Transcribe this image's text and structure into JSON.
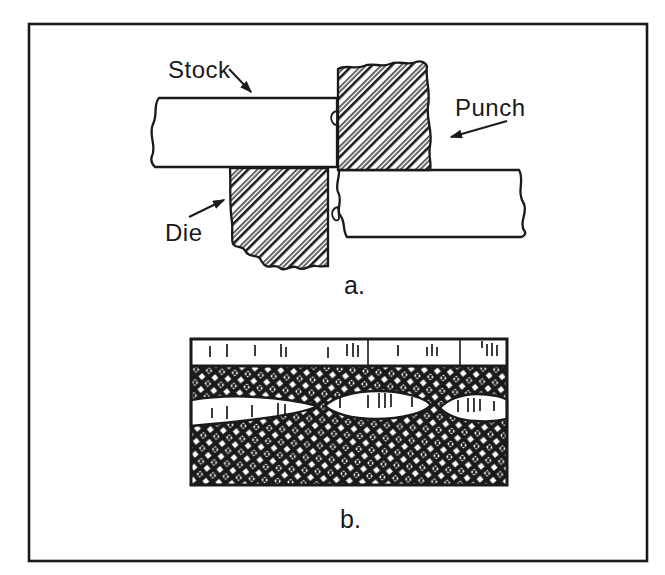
{
  "figure": {
    "colors": {
      "ink": "#1a1a1a",
      "paper": "#ffffff"
    },
    "panel_a": {
      "caption": "a.",
      "stock_label": "Stock",
      "punch_label": "Punch",
      "die_label": "Die"
    },
    "panel_b": {
      "caption": "b.",
      "ticks": {
        "strip": [
          {
            "x": 210,
            "y": 346,
            "h": 11
          },
          {
            "x": 227,
            "y": 344,
            "h": 13
          },
          {
            "x": 255,
            "y": 345,
            "h": 11
          },
          {
            "x": 281,
            "y": 344,
            "h": 13
          },
          {
            "x": 286,
            "y": 347,
            "h": 10
          },
          {
            "x": 328,
            "y": 347,
            "h": 11
          },
          {
            "x": 347,
            "y": 344,
            "h": 12
          },
          {
            "x": 353,
            "y": 343,
            "h": 14
          },
          {
            "x": 358,
            "y": 345,
            "h": 12
          },
          {
            "x": 398,
            "y": 345,
            "h": 11
          },
          {
            "x": 427,
            "y": 347,
            "h": 9
          },
          {
            "x": 432,
            "y": 344,
            "h": 12
          },
          {
            "x": 437,
            "y": 347,
            "h": 9
          },
          {
            "x": 482,
            "y": 341,
            "h": 7
          },
          {
            "x": 487,
            "y": 344,
            "h": 12
          },
          {
            "x": 492,
            "y": 343,
            "h": 13
          },
          {
            "x": 497,
            "y": 345,
            "h": 11
          }
        ],
        "dividers": [
          {
            "x": 368,
            "y": 340,
            "h": 26
          },
          {
            "x": 460,
            "y": 340,
            "h": 26
          }
        ],
        "lenses": [
          {
            "x": 212,
            "y": 408,
            "h": 10
          },
          {
            "x": 227,
            "y": 406,
            "h": 13
          },
          {
            "x": 252,
            "y": 405,
            "h": 12
          },
          {
            "x": 278,
            "y": 403,
            "h": 13
          },
          {
            "x": 285,
            "y": 404,
            "h": 11
          },
          {
            "x": 340,
            "y": 398,
            "h": 10
          },
          {
            "x": 368,
            "y": 395,
            "h": 13
          },
          {
            "x": 379,
            "y": 393,
            "h": 15
          },
          {
            "x": 385,
            "y": 393,
            "h": 15
          },
          {
            "x": 391,
            "y": 394,
            "h": 13
          },
          {
            "x": 412,
            "y": 397,
            "h": 10
          },
          {
            "x": 458,
            "y": 400,
            "h": 12
          },
          {
            "x": 468,
            "y": 398,
            "h": 14
          },
          {
            "x": 474,
            "y": 398,
            "h": 14
          },
          {
            "x": 480,
            "y": 399,
            "h": 12
          },
          {
            "x": 494,
            "y": 401,
            "h": 10
          }
        ]
      }
    }
  }
}
